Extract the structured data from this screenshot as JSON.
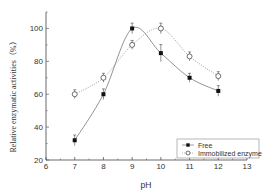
{
  "chart_data": {
    "type": "line",
    "title": "",
    "xlabel": "pH",
    "ylabel": "Relative enzymatic activities（%）",
    "xlim": [
      6,
      13
    ],
    "ylim": [
      20,
      110
    ],
    "x_ticks": [
      6,
      7,
      8,
      9,
      10,
      11,
      12,
      13
    ],
    "y_ticks": [
      20,
      40,
      60,
      80,
      100
    ],
    "grid": false,
    "legend_position": "lower right",
    "x": [
      7,
      8,
      9,
      10,
      11,
      12
    ],
    "series": [
      {
        "name": "Free",
        "marker": "filled-square",
        "line": "solid",
        "values": [
          32,
          60,
          100,
          85,
          70,
          62
        ],
        "errors": [
          2,
          2,
          2,
          4,
          1.5,
          2
        ]
      },
      {
        "name": "Immobilized enzyme",
        "marker": "open-circle",
        "line": "dotted",
        "values": [
          60,
          70,
          90,
          100,
          83,
          71
        ],
        "errors": [
          1.5,
          1.5,
          1.5,
          2,
          1.5,
          1.5
        ]
      }
    ]
  },
  "legend": {
    "items": [
      {
        "label": "Free"
      },
      {
        "label": "Immobilized enzyme"
      }
    ]
  },
  "axes": {
    "xlabel": "pH",
    "ylabel": "Relative enzymatic activities（%）"
  },
  "colors": {
    "free_line": "#777777",
    "immobilized_line": "#999999",
    "marker": "#111111",
    "axis": "#444444"
  }
}
